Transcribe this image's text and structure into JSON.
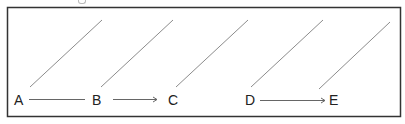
{
  "diagram": {
    "colors": {
      "frame": "#333333",
      "diagonal": "#8c8c8c",
      "arrow": "#666666",
      "label": "#222222"
    },
    "nodes": [
      {
        "id": "A",
        "label": "A",
        "x": 14,
        "y": 93
      },
      {
        "id": "B",
        "label": "B",
        "x": 92,
        "y": 93
      },
      {
        "id": "C",
        "label": "C",
        "x": 168,
        "y": 93
      },
      {
        "id": "D",
        "label": "D",
        "x": 245,
        "y": 93
      },
      {
        "id": "E",
        "label": "E",
        "x": 329,
        "y": 93
      }
    ],
    "edges": [
      {
        "from": "A",
        "to": "B",
        "arrowhead": false
      },
      {
        "from": "B",
        "to": "C",
        "arrowhead": true
      },
      {
        "from": "D",
        "to": "E",
        "arrowhead": true
      }
    ],
    "diagonals": [
      {
        "x1": 30,
        "y1": 87,
        "x2": 102,
        "y2": 20
      },
      {
        "x1": 101,
        "y1": 87,
        "x2": 173,
        "y2": 20
      },
      {
        "x1": 176,
        "y1": 87,
        "x2": 248,
        "y2": 20
      },
      {
        "x1": 251,
        "y1": 87,
        "x2": 323,
        "y2": 20
      },
      {
        "x1": 319,
        "y1": 89,
        "x2": 390,
        "y2": 22
      }
    ]
  }
}
